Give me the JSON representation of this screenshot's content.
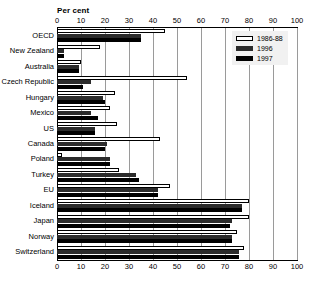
{
  "chart_data": {
    "type": "bar",
    "orientation": "horizontal",
    "title": "",
    "xlabel": "Per cent",
    "ylabel": "",
    "xlim": [
      0,
      100
    ],
    "xticks": [
      0,
      10,
      20,
      30,
      40,
      50,
      60,
      70,
      80,
      90,
      100
    ],
    "grid": true,
    "legend_position": "top-right",
    "categories": [
      "OECD",
      "New Zealand",
      "Australia",
      "Czech Republic",
      "Hungary",
      "Mexico",
      "US",
      "Canada",
      "Poland",
      "Turkey",
      "EU",
      "Iceland",
      "Japan",
      "Norway",
      "Switzerland"
    ],
    "series": [
      {
        "name": "1986-88",
        "color": "#ffffff",
        "values": [
          45,
          18,
          10,
          54,
          24,
          22,
          25,
          43,
          2,
          26,
          47,
          80,
          80,
          75,
          78
        ]
      },
      {
        "name": "1996",
        "color": "#2b2b2b",
        "values": [
          35,
          3,
          9,
          14,
          19,
          14,
          16,
          21,
          22,
          33,
          42,
          77,
          73,
          73,
          76
        ]
      },
      {
        "name": "1997",
        "color": "#000000",
        "values": [
          35,
          3,
          9,
          11,
          20,
          17,
          16,
          20,
          22,
          34,
          42,
          77,
          72,
          73,
          76
        ]
      }
    ]
  },
  "caption": "",
  "colors": {
    "grid": "#9a9a9a",
    "axis": "#000000",
    "legend_background": "#f1f1f1"
  }
}
